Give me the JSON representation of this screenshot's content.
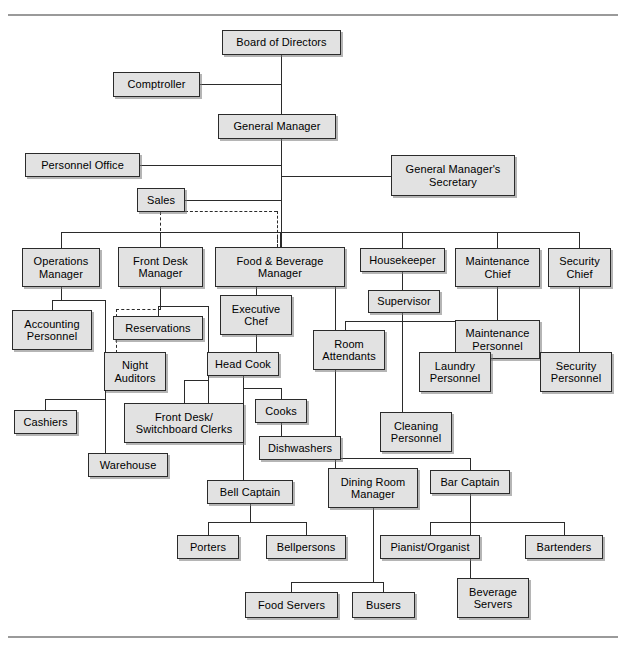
{
  "chart_data": {
    "type": "diagram",
    "diagram_kind": "organizational-chart",
    "nodes": [
      {
        "id": "board",
        "label": "Board of Directors",
        "x": 222,
        "y": 30,
        "w": 119,
        "h": 25
      },
      {
        "id": "comptroller",
        "label": "Comptroller",
        "x": 113,
        "y": 72,
        "w": 87,
        "h": 25
      },
      {
        "id": "gm",
        "label": "General Manager",
        "x": 218,
        "y": 114,
        "w": 118,
        "h": 25
      },
      {
        "id": "personnel",
        "label": "Personnel Office",
        "x": 25,
        "y": 153,
        "w": 115,
        "h": 24
      },
      {
        "id": "gmsec",
        "label": "General Manager's\nSecretary",
        "x": 391,
        "y": 155,
        "w": 124,
        "h": 41
      },
      {
        "id": "sales",
        "label": "Sales",
        "x": 137,
        "y": 188,
        "w": 48,
        "h": 24
      },
      {
        "id": "opsmgr",
        "label": "Operations\nManager",
        "x": 22,
        "y": 248,
        "w": 78,
        "h": 39
      },
      {
        "id": "fdmgr",
        "label": "Front  Desk\nManager",
        "x": 118,
        "y": 247,
        "w": 85,
        "h": 40
      },
      {
        "id": "fbmgr",
        "label": "Food  &  Beverage\nManager",
        "x": 215,
        "y": 247,
        "w": 130,
        "h": 40
      },
      {
        "id": "housekeeper",
        "label": "Housekeeper",
        "x": 360,
        "y": 248,
        "w": 85,
        "h": 24
      },
      {
        "id": "maintchief",
        "label": "Maintenance\nChief",
        "x": 455,
        "y": 248,
        "w": 85,
        "h": 39
      },
      {
        "id": "secchief",
        "label": "Security\nChief",
        "x": 548,
        "y": 248,
        "w": 63,
        "h": 39
      },
      {
        "id": "acctpers",
        "label": "Accounting\nPersonnel",
        "x": 12,
        "y": 310,
        "w": 80,
        "h": 40
      },
      {
        "id": "reservations",
        "label": "Reservations",
        "x": 113,
        "y": 316,
        "w": 90,
        "h": 24
      },
      {
        "id": "execchef",
        "label": "Executive\nChef",
        "x": 220,
        "y": 295,
        "w": 72,
        "h": 40
      },
      {
        "id": "supervisor",
        "label": "Supervisor",
        "x": 368,
        "y": 290,
        "w": 72,
        "h": 23
      },
      {
        "id": "maintpers",
        "label": "Maintenance\nPersonnel",
        "x": 455,
        "y": 320,
        "w": 85,
        "h": 39
      },
      {
        "id": "nightaud",
        "label": "Night\nAuditors",
        "x": 104,
        "y": 352,
        "w": 62,
        "h": 39
      },
      {
        "id": "roomatt",
        "label": "Room\nAttendants",
        "x": 313,
        "y": 330,
        "w": 72,
        "h": 40
      },
      {
        "id": "laundry",
        "label": "Laundry\nPersonnel",
        "x": 419,
        "y": 352,
        "w": 72,
        "h": 40
      },
      {
        "id": "headcook",
        "label": "Head Cook",
        "x": 207,
        "y": 352,
        "w": 72,
        "h": 24
      },
      {
        "id": "secpers",
        "label": "Security\nPersonnel",
        "x": 540,
        "y": 352,
        "w": 72,
        "h": 40
      },
      {
        "id": "cashiers",
        "label": "Cashiers",
        "x": 14,
        "y": 410,
        "w": 63,
        "h": 24
      },
      {
        "id": "fdclerks",
        "label": "Front Desk/\nSwitchboard Clerks",
        "x": 124,
        "y": 403,
        "w": 120,
        "h": 40
      },
      {
        "id": "cooks",
        "label": "Cooks",
        "x": 255,
        "y": 399,
        "w": 52,
        "h": 24
      },
      {
        "id": "cleaning",
        "label": "Cleaning\nPersonnel",
        "x": 380,
        "y": 412,
        "w": 72,
        "h": 40
      },
      {
        "id": "warehouse",
        "label": "Warehouse",
        "x": 88,
        "y": 453,
        "w": 80,
        "h": 24
      },
      {
        "id": "dishwashers",
        "label": "Dishwashers",
        "x": 259,
        "y": 436,
        "w": 82,
        "h": 24
      },
      {
        "id": "bellcaptain",
        "label": "Bell Captain",
        "x": 207,
        "y": 480,
        "w": 86,
        "h": 24
      },
      {
        "id": "diningmgr",
        "label": "Dining Room\nManager",
        "x": 328,
        "y": 468,
        "w": 90,
        "h": 40
      },
      {
        "id": "barcaptain",
        "label": "Bar Captain",
        "x": 430,
        "y": 470,
        "w": 80,
        "h": 24
      },
      {
        "id": "porters",
        "label": "Porters",
        "x": 177,
        "y": 535,
        "w": 62,
        "h": 24
      },
      {
        "id": "bellpersons",
        "label": "Bellpersons",
        "x": 266,
        "y": 535,
        "w": 80,
        "h": 24
      },
      {
        "id": "pianist",
        "label": "Pianist/Organist",
        "x": 380,
        "y": 535,
        "w": 100,
        "h": 24
      },
      {
        "id": "bartenders",
        "label": "Bartenders",
        "x": 525,
        "y": 535,
        "w": 78,
        "h": 24
      },
      {
        "id": "foodservers",
        "label": "Food Servers",
        "x": 245,
        "y": 592,
        "w": 93,
        "h": 26
      },
      {
        "id": "busers",
        "label": "Busers",
        "x": 352,
        "y": 592,
        "w": 63,
        "h": 26
      },
      {
        "id": "bevservers",
        "label": "Beverage\nServers",
        "x": 457,
        "y": 578,
        "w": 72,
        "h": 40
      }
    ],
    "edges": [
      {
        "from": "board",
        "to": "gm",
        "style": "solid"
      },
      {
        "from": "board",
        "to": "comptroller",
        "style": "solid"
      },
      {
        "from": "gm",
        "to": "personnel",
        "style": "solid"
      },
      {
        "from": "gm",
        "to": "gmsec",
        "style": "solid"
      },
      {
        "from": "gm",
        "to": "sales",
        "style": "solid"
      },
      {
        "from": "gm",
        "to": "opsmgr",
        "style": "solid"
      },
      {
        "from": "gm",
        "to": "fdmgr",
        "style": "solid"
      },
      {
        "from": "gm",
        "to": "fbmgr",
        "style": "solid"
      },
      {
        "from": "gm",
        "to": "housekeeper",
        "style": "solid"
      },
      {
        "from": "gm",
        "to": "maintchief",
        "style": "solid"
      },
      {
        "from": "gm",
        "to": "secchief",
        "style": "solid"
      },
      {
        "from": "sales",
        "to": "fdmgr",
        "style": "dashed"
      },
      {
        "from": "sales",
        "to": "fbmgr",
        "style": "dashed"
      },
      {
        "from": "sales",
        "to": "nightaud",
        "style": "dashed"
      },
      {
        "from": "opsmgr",
        "to": "acctpers",
        "style": "solid"
      },
      {
        "from": "opsmgr",
        "to": "cashiers",
        "style": "solid"
      },
      {
        "from": "opsmgr",
        "to": "warehouse",
        "style": "solid"
      },
      {
        "from": "fdmgr",
        "to": "reservations",
        "style": "solid"
      },
      {
        "from": "fdmgr",
        "to": "nightaud",
        "style": "solid"
      },
      {
        "from": "fdmgr",
        "to": "fdclerks",
        "style": "solid"
      },
      {
        "from": "fbmgr",
        "to": "execchef",
        "style": "solid"
      },
      {
        "from": "fbmgr",
        "to": "diningmgr",
        "style": "solid"
      },
      {
        "from": "fbmgr",
        "to": "barcaptain",
        "style": "solid"
      },
      {
        "from": "execchef",
        "to": "headcook",
        "style": "solid"
      },
      {
        "from": "headcook",
        "to": "cooks",
        "style": "solid"
      },
      {
        "from": "headcook",
        "to": "bellcaptain",
        "style": "solid"
      },
      {
        "from": "cooks",
        "to": "dishwashers",
        "style": "solid"
      },
      {
        "from": "housekeeper",
        "to": "supervisor",
        "style": "solid"
      },
      {
        "from": "supervisor",
        "to": "roomatt",
        "style": "solid"
      },
      {
        "from": "supervisor",
        "to": "laundry",
        "style": "solid"
      },
      {
        "from": "supervisor",
        "to": "cleaning",
        "style": "solid"
      },
      {
        "from": "maintchief",
        "to": "maintpers",
        "style": "solid"
      },
      {
        "from": "secchief",
        "to": "secpers",
        "style": "solid"
      },
      {
        "from": "bellcaptain",
        "to": "porters",
        "style": "solid"
      },
      {
        "from": "bellcaptain",
        "to": "bellpersons",
        "style": "solid"
      },
      {
        "from": "diningmgr",
        "to": "foodservers",
        "style": "solid"
      },
      {
        "from": "diningmgr",
        "to": "busers",
        "style": "solid"
      },
      {
        "from": "barcaptain",
        "to": "pianist",
        "style": "solid"
      },
      {
        "from": "barcaptain",
        "to": "bartenders",
        "style": "solid"
      },
      {
        "from": "barcaptain",
        "to": "bevservers",
        "style": "solid"
      }
    ],
    "colors": {
      "node_fill": "#e2e2e2",
      "node_border": "#2b2b2b",
      "line": "#2b2b2b",
      "rule": "#9a9a9a",
      "background": "#ffffff"
    }
  },
  "connectors": [
    {
      "name": "board-down-to-gm",
      "type": "v",
      "x": 281,
      "y": 55,
      "len": 59
    },
    {
      "name": "comptroller-to-trunk",
      "type": "h",
      "x": 200,
      "y": 84,
      "len": 81
    },
    {
      "name": "gm-trunk-down",
      "type": "v",
      "x": 281,
      "y": 139,
      "len": 110
    },
    {
      "name": "personnel-to-trunk",
      "type": "h",
      "x": 140,
      "y": 165,
      "len": 141
    },
    {
      "name": "gmsec-to-trunk",
      "type": "h",
      "x": 281,
      "y": 176,
      "len": 110
    },
    {
      "name": "sales-to-trunk",
      "type": "h",
      "x": 185,
      "y": 200,
      "len": 96
    },
    {
      "name": "managers-bus",
      "type": "h",
      "x": 61,
      "y": 232,
      "len": 519
    },
    {
      "name": "bus-to-opsmgr",
      "type": "v",
      "x": 61,
      "y": 232,
      "len": 16
    },
    {
      "name": "bus-to-fdmgr",
      "type": "v",
      "x": 160,
      "y": 232,
      "len": 15
    },
    {
      "name": "bus-to-fbmgr",
      "type": "v",
      "x": 280,
      "y": 232,
      "len": 15
    },
    {
      "name": "bus-to-housekeeper",
      "type": "v",
      "x": 402,
      "y": 232,
      "len": 16
    },
    {
      "name": "bus-to-maintchief",
      "type": "v",
      "x": 497,
      "y": 232,
      "len": 16
    },
    {
      "name": "bus-to-secchief",
      "type": "v",
      "x": 579,
      "y": 232,
      "len": 16
    },
    {
      "name": "opsmgr-down",
      "type": "v",
      "x": 61,
      "y": 287,
      "len": 13
    },
    {
      "name": "ops-children-bus",
      "type": "h",
      "x": 52,
      "y": 300,
      "len": 53
    },
    {
      "name": "ops-to-acct",
      "type": "v",
      "x": 52,
      "y": 300,
      "len": 10
    },
    {
      "name": "ops-spine-down",
      "type": "v",
      "x": 105,
      "y": 300,
      "len": 122
    },
    {
      "name": "ops-lower-bus",
      "type": "h",
      "x": 45,
      "y": 399,
      "len": 60
    },
    {
      "name": "ops-to-cashiers",
      "type": "v",
      "x": 45,
      "y": 399,
      "len": 11
    },
    {
      "name": "ops-to-warehouse",
      "type": "v",
      "x": 105,
      "y": 422,
      "len": 31
    },
    {
      "name": "fdmgr-down",
      "type": "v",
      "x": 160,
      "y": 287,
      "len": 19
    },
    {
      "name": "fd-children-bus",
      "type": "h",
      "x": 158,
      "y": 306,
      "len": 50
    },
    {
      "name": "fd-to-reservations",
      "type": "v",
      "x": 158,
      "y": 306,
      "len": 10
    },
    {
      "name": "fd-spine-down",
      "type": "v",
      "x": 208,
      "y": 306,
      "len": 97
    },
    {
      "name": "fd-to-clerks",
      "type": "v",
      "x": 184,
      "y": 380,
      "len": 23
    },
    {
      "name": "fd-clerks-bus",
      "type": "h",
      "x": 184,
      "y": 380,
      "len": 24
    },
    {
      "name": "fbmgr-down-left",
      "type": "v",
      "x": 256,
      "y": 287,
      "len": 8
    },
    {
      "name": "fb-children-bus",
      "type": "h",
      "x": 256,
      "y": 295,
      "len": 0
    },
    {
      "name": "execchef-down",
      "type": "v",
      "x": 256,
      "y": 335,
      "len": 17
    },
    {
      "name": "headcook-down",
      "type": "v",
      "x": 243,
      "y": 376,
      "len": 23
    },
    {
      "name": "headcook-bus",
      "type": "h",
      "x": 243,
      "y": 388,
      "len": 38
    },
    {
      "name": "cooks-down",
      "type": "v",
      "x": 281,
      "y": 388,
      "len": 11
    },
    {
      "name": "cooks-to-dish",
      "type": "v",
      "x": 281,
      "y": 423,
      "len": 13
    },
    {
      "name": "headcook-to-bell",
      "type": "v",
      "x": 243,
      "y": 388,
      "len": 92
    },
    {
      "name": "fbmgr-spine-right",
      "type": "v",
      "x": 335,
      "y": 287,
      "len": 171
    },
    {
      "name": "fb-bottom-bus",
      "type": "h",
      "x": 335,
      "y": 458,
      "len": 135
    },
    {
      "name": "fb-to-dining",
      "type": "v",
      "x": 335,
      "y": 458,
      "len": 10
    },
    {
      "name": "fb-to-bar",
      "type": "v",
      "x": 470,
      "y": 458,
      "len": 12
    },
    {
      "name": "housekeeper-down",
      "type": "v",
      "x": 402,
      "y": 272,
      "len": 18
    },
    {
      "name": "supervisor-down",
      "type": "v",
      "x": 402,
      "y": 313,
      "len": 8
    },
    {
      "name": "supervisor-bus",
      "type": "h",
      "x": 345,
      "y": 321,
      "len": 110
    },
    {
      "name": "sup-to-roomatt",
      "type": "v",
      "x": 345,
      "y": 321,
      "len": 9
    },
    {
      "name": "sup-to-laundry",
      "type": "v",
      "x": 455,
      "y": 321,
      "len": 31
    },
    {
      "name": "sup-to-cleaning",
      "type": "v",
      "x": 402,
      "y": 321,
      "len": 91
    },
    {
      "name": "maintchief-down",
      "type": "v",
      "x": 497,
      "y": 287,
      "len": 33
    },
    {
      "name": "secchief-down",
      "type": "v",
      "x": 579,
      "y": 287,
      "len": 65
    },
    {
      "name": "bellcaptain-down",
      "type": "v",
      "x": 250,
      "y": 504,
      "len": 18
    },
    {
      "name": "bell-bus",
      "type": "h",
      "x": 208,
      "y": 522,
      "len": 98
    },
    {
      "name": "bell-to-porters",
      "type": "v",
      "x": 208,
      "y": 522,
      "len": 13
    },
    {
      "name": "bell-to-bellpersons",
      "type": "v",
      "x": 306,
      "y": 522,
      "len": 13
    },
    {
      "name": "dining-down",
      "type": "v",
      "x": 373,
      "y": 508,
      "len": 74
    },
    {
      "name": "dining-bus",
      "type": "h",
      "x": 291,
      "y": 582,
      "len": 92
    },
    {
      "name": "dining-to-foodservers",
      "type": "v",
      "x": 291,
      "y": 582,
      "len": 10
    },
    {
      "name": "dining-to-busers",
      "type": "v",
      "x": 383,
      "y": 582,
      "len": 10
    },
    {
      "name": "bar-down",
      "type": "v",
      "x": 470,
      "y": 494,
      "len": 84
    },
    {
      "name": "bar-bus",
      "type": "h",
      "x": 430,
      "y": 522,
      "len": 134
    },
    {
      "name": "bar-to-pianist",
      "type": "v",
      "x": 430,
      "y": 522,
      "len": 13
    },
    {
      "name": "bar-to-bartenders",
      "type": "v",
      "x": 564,
      "y": 522,
      "len": 13
    },
    {
      "name": "bar-to-bevservers",
      "type": "v",
      "x": 470,
      "y": 522,
      "len": 56
    }
  ],
  "dashed_connectors": [
    {
      "name": "sales-dash-right",
      "type": "h",
      "x": 185,
      "y": 211,
      "len": 92
    },
    {
      "name": "sales-dash-right-down",
      "type": "v",
      "x": 277,
      "y": 211,
      "len": 36
    },
    {
      "name": "sales-dash-to-fbmgr",
      "type": "v",
      "x": 277,
      "y": 236,
      "len": 11
    },
    {
      "name": "sales-dash-down-left",
      "type": "v",
      "x": 160,
      "y": 212,
      "len": 35
    },
    {
      "name": "sales-dash-fd-down",
      "type": "v",
      "x": 160,
      "y": 287,
      "len": 22
    },
    {
      "name": "sales-dash-fd-bus",
      "type": "h",
      "x": 116,
      "y": 309,
      "len": 45
    },
    {
      "name": "sales-dash-night",
      "type": "v",
      "x": 116,
      "y": 309,
      "len": 44
    }
  ]
}
